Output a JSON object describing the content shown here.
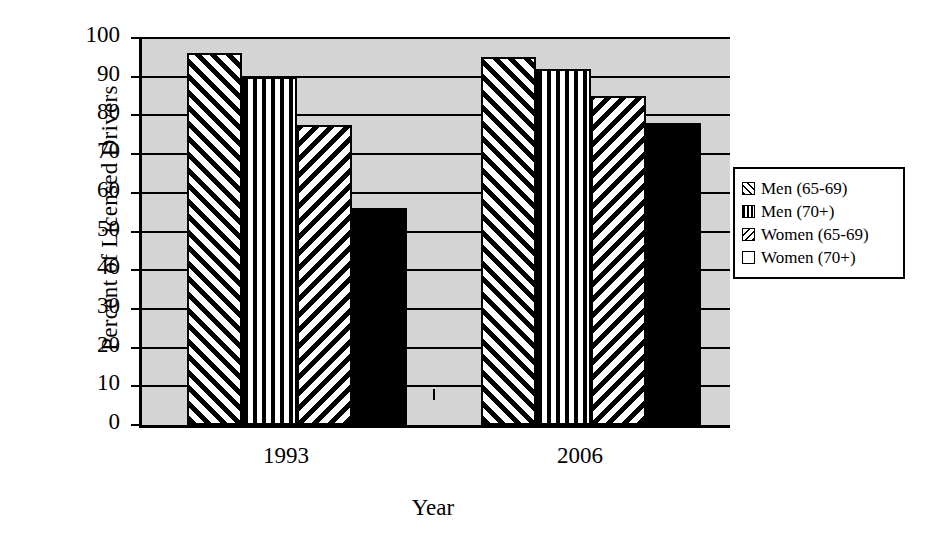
{
  "chart_data": {
    "type": "bar",
    "title": "",
    "xlabel": "Year",
    "ylabel": "Percent of Licensed Drivers",
    "categories": [
      "1993",
      "2006"
    ],
    "ylim": [
      0,
      100
    ],
    "yticks": [
      0,
      10,
      20,
      30,
      40,
      50,
      60,
      70,
      80,
      90,
      100
    ],
    "ytick_labels": [
      "0",
      "10",
      "20",
      "30",
      "40",
      "50",
      "60",
      "70",
      "80",
      "90",
      "100"
    ],
    "grid": true,
    "legend_position": "right",
    "series": [
      {
        "name": "Men (65-69)",
        "pattern": "diagonal-up-hatch",
        "values": [
          96,
          95
        ]
      },
      {
        "name": "Men (70+)",
        "pattern": "vertical-stripe",
        "values": [
          90,
          92
        ]
      },
      {
        "name": "Women (65-69)",
        "pattern": "diagonal-down-hatch",
        "values": [
          77.5,
          85
        ]
      },
      {
        "name": "Women (70+)",
        "pattern": "solid-black",
        "values": [
          56,
          78
        ]
      }
    ],
    "colors": {
      "plot_background": "#d4d4d4",
      "axis": "#000000",
      "gridline": "#000000",
      "bar_fill": "#ffffff",
      "bar_outline": "#000000",
      "solid_series": "#000000",
      "figure_background": "#ffffff"
    }
  },
  "axis": {
    "ylabel": "Percent of Licensed Drivers",
    "xlabel": "Year",
    "ytick_labels": [
      "100",
      "90",
      "80",
      "70",
      "60",
      "50",
      "40",
      "30",
      "20",
      "10",
      "0"
    ],
    "xtick_labels": [
      "1993",
      "2006"
    ]
  },
  "legend": {
    "items": [
      {
        "label": "Men (65-69)"
      },
      {
        "label": "Men (70+)"
      },
      {
        "label": "Women (65-69)"
      },
      {
        "label": "Women (70+)"
      }
    ]
  }
}
